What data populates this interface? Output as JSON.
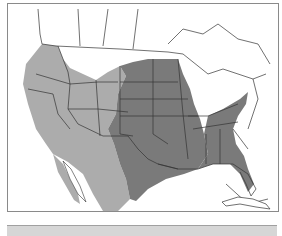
{
  "map": {
    "type": "species-range-map",
    "region": "North America (United States, southern Canada, northern Mexico)",
    "colors": {
      "ocean": "#ffffff",
      "land": "#ffffff",
      "border": "#333333",
      "range_light": "#acacac",
      "range_dark": "#7a7a7a",
      "frame": "#8a8a8a"
    },
    "legend": [
      {
        "label": "Western range",
        "color": "#acacac"
      },
      {
        "label": "Central / southeastern range",
        "color": "#7a7a7a"
      }
    ]
  },
  "bottom_bar": {
    "color": "#d6d6d6"
  }
}
